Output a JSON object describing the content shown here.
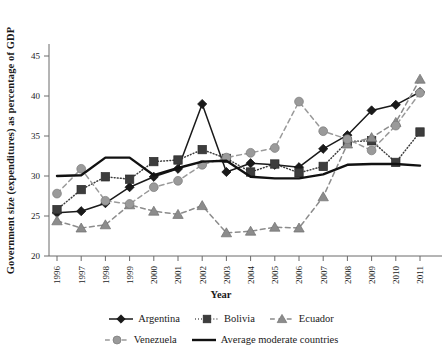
{
  "chart_data": {
    "type": "line",
    "title": "",
    "xlabel": "Year",
    "ylabel": "Government size (expenditures) as percentage of GDP",
    "x": [
      1996,
      1997,
      1998,
      1999,
      2000,
      2001,
      2002,
      2003,
      2004,
      2005,
      2006,
      2007,
      2008,
      2009,
      2010,
      2011
    ],
    "categories": [
      "1996",
      "1997",
      "1998",
      "1999",
      "2000",
      "2001",
      "2002",
      "2003",
      "2004",
      "2005",
      "2006",
      "2007",
      "2008",
      "2009",
      "2010",
      "2011"
    ],
    "xlim": [
      1996,
      2011
    ],
    "ylim": [
      20,
      45
    ],
    "yticks": [
      20,
      25,
      30,
      35,
      40,
      45
    ],
    "ytick_labels": [
      "20",
      "25",
      "30",
      "35",
      "40",
      "45"
    ],
    "grid": false,
    "legend_position": "bottom",
    "series": [
      {
        "name": "Argentina",
        "marker": "diamond",
        "linestyle": "solid",
        "color": "#1a1a1a",
        "values": [
          25.4,
          25.6,
          26.6,
          28.6,
          29.9,
          30.9,
          39.0,
          30.5,
          31.6,
          31.4,
          31.1,
          33.4,
          35.1,
          38.2,
          38.9,
          40.5
        ]
      },
      {
        "name": "Bolivia",
        "marker": "square",
        "linestyle": "dotted",
        "color": "#3d3d3d",
        "values": [
          25.8,
          28.3,
          29.9,
          29.6,
          31.8,
          32.0,
          33.3,
          32.2,
          30.5,
          31.5,
          30.4,
          31.2,
          34.3,
          34.4,
          31.7,
          35.5
        ]
      },
      {
        "name": "Ecuador",
        "marker": "triangle",
        "linestyle": "dashed",
        "color": "#8c8c8c",
        "values": [
          24.4,
          23.5,
          23.9,
          26.4,
          25.6,
          25.2,
          26.3,
          22.9,
          23.1,
          23.6,
          23.5,
          27.4,
          34.0,
          34.8,
          36.7,
          42.1
        ]
      },
      {
        "name": "Venezuela",
        "marker": "circle",
        "linestyle": "dashed",
        "color": "#9a9a9a",
        "values": [
          27.8,
          30.9,
          26.9,
          26.5,
          28.6,
          29.4,
          31.4,
          32.3,
          32.9,
          33.5,
          39.3,
          35.6,
          34.6,
          33.2,
          36.3,
          40.4
        ]
      },
      {
        "name": "Average moderate countries",
        "marker": "none",
        "linestyle": "solid",
        "color": "#111111",
        "linewidth": 2.4,
        "values": [
          30.0,
          30.1,
          32.3,
          32.3,
          30.1,
          31.0,
          31.8,
          31.9,
          29.9,
          29.7,
          29.7,
          30.2,
          31.4,
          31.5,
          31.5,
          31.3
        ]
      }
    ]
  },
  "axis": {
    "y_title": "Government size (expenditures) as percentage of GDP",
    "x_title": "Year"
  },
  "legend": {
    "row1": [
      {
        "label": "Argentina",
        "marker": "diamond",
        "line": "solid",
        "color": "#1a1a1a"
      },
      {
        "label": "Bolivia",
        "marker": "square",
        "line": "dotted",
        "color": "#3d3d3d"
      },
      {
        "label": "Ecuador",
        "marker": "triangle",
        "line": "dashed",
        "color": "#8c8c8c"
      }
    ],
    "row2": [
      {
        "label": "Venezuela",
        "marker": "circle",
        "line": "dashed",
        "color": "#9a9a9a"
      },
      {
        "label": "Average moderate countries",
        "marker": "none",
        "line": "solid",
        "color": "#111111"
      }
    ]
  }
}
